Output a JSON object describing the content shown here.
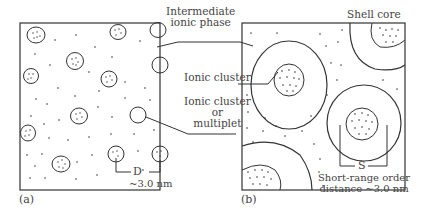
{
  "diagram": {
    "panels": [
      {
        "id": "a",
        "tag": "(a)",
        "spacing_label": "D",
        "spacing_value": "~3.0 nm"
      },
      {
        "id": "b",
        "tag": "(b)",
        "spacing_label": "S",
        "spacing_value_line1": "Short-range order",
        "spacing_value_line2": "distance ~3.0 nm"
      }
    ],
    "labels": {
      "intermediate_line1": "Intermediate",
      "intermediate_line2": "ionic phase",
      "ionic_cluster": "Ionic cluster",
      "multiplet_line1": "Ionic cluster",
      "multiplet_line2": "or",
      "multiplet_line3": "multiplet",
      "shell_core": "Shell core"
    },
    "colors": {
      "line": "#333333",
      "background": "#ffffff"
    }
  }
}
